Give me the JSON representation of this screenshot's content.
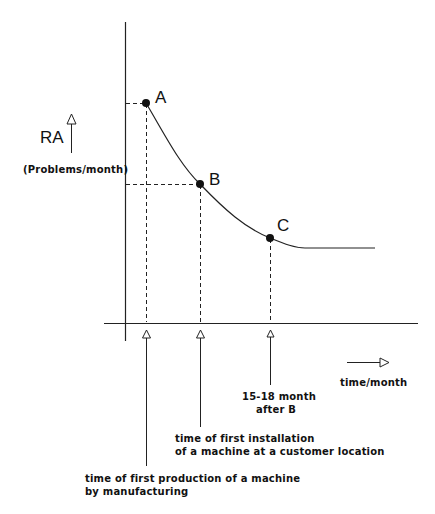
{
  "diagram": {
    "y_axis": {
      "label": "RA",
      "unit": "(Problems/month)"
    },
    "x_axis": {
      "label": "time/month"
    },
    "points": [
      {
        "id": "A",
        "label": "A"
      },
      {
        "id": "B",
        "label": "B"
      },
      {
        "id": "C",
        "label": "C"
      }
    ],
    "annotations": {
      "c_note_line1": "15-18 month",
      "c_note_line2": "after B",
      "b_note_line1": "time of first installation",
      "b_note_line2": "of a machine at a customer location",
      "a_note_line1": "time of first production of a machine",
      "a_note_line2": "by manufacturing"
    },
    "colors": {
      "line": "#222222",
      "background": "#ffffff"
    }
  }
}
